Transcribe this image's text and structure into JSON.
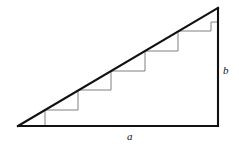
{
  "figure": {
    "kind": "staircase-approximation-right-triangle",
    "canvas": {
      "width": 239,
      "height": 147
    },
    "colors": {
      "background": "#ffffff",
      "triangle_stroke": "#111111",
      "staircase_stroke": "#808080",
      "label_color": "#111111"
    },
    "stroke_widths": {
      "triangle": 2.1,
      "staircase": 1.0
    },
    "triangle": {
      "vertices": {
        "left": {
          "x": 18,
          "y": 126
        },
        "bottom_right": {
          "x": 218,
          "y": 126
        },
        "top_right": {
          "x": 218,
          "y": 8
        }
      },
      "legs": {
        "horizontal_label": "a",
        "vertical_label": "b"
      }
    },
    "staircase": {
      "step_count": 6,
      "step_width": 33.33,
      "step_height": 19.67,
      "points": [
        {
          "x": 45,
          "y": 126
        },
        {
          "x": 45,
          "y": 110
        },
        {
          "x": 78,
          "y": 110
        },
        {
          "x": 78,
          "y": 90
        },
        {
          "x": 111,
          "y": 90
        },
        {
          "x": 111,
          "y": 71
        },
        {
          "x": 145,
          "y": 71
        },
        {
          "x": 145,
          "y": 51
        },
        {
          "x": 178,
          "y": 51
        },
        {
          "x": 178,
          "y": 31
        },
        {
          "x": 211,
          "y": 31
        },
        {
          "x": 211,
          "y": 22
        },
        {
          "x": 218,
          "y": 22
        }
      ]
    },
    "labels": {
      "a": "a",
      "b": "b"
    }
  }
}
